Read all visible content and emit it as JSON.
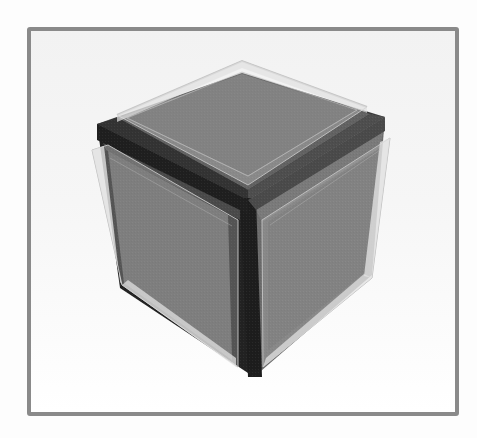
{
  "figure": {
    "title": "",
    "colors": {
      "background": "#fdfdfd",
      "frame_border": "#8a8a8a",
      "core_dark": "#1f1f1f",
      "core_edge_dark": "#262626",
      "core_top_band": "#3c3c3c",
      "core_right_band": "#6e6e6e",
      "face_gray": "#5f5f5f",
      "face_gray_light": "#707070",
      "plate_fill": "rgba(235,235,235,0.45)",
      "plate_stroke": "#b5b5b5"
    },
    "core": {
      "top_face": "97,124 242,73 385,117 248,200",
      "left_face": "97,124 248,200 254,377 120,288",
      "right_face": "248,200 385,117 372,275 254,377",
      "vertical_edge": "240,198 256,198 262,377 248,377",
      "left_top_edge": "97,124 248,200 248,214 97,140",
      "right_top_edge": "248,200 385,117 385,131 256,210"
    },
    "plates": {
      "top": {
        "outer": "117,115 242,61 367,107 248,185",
        "inner": "127,118 242,72 357,110 248,176"
      },
      "left": {
        "outer": "92,150 108,145 238,220 238,367 122,285",
        "inner": "106,162 116,158 232,226 232,356 128,282"
      },
      "right": {
        "outer": "262,220 390,138 372,278 263,367",
        "inner": "270,225 380,150 364,274 270,356"
      }
    }
  }
}
